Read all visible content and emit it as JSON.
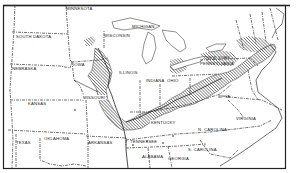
{
  "map": {
    "type": "distribution-map",
    "region": "Central and Eastern United States",
    "style": "black-and-white line drawing with diagonal hatching marking distribution area",
    "colors": {
      "ink": "#222222",
      "background": "#ffffff",
      "hatch": "#333333"
    },
    "labels": [
      {
        "id": "minnesota",
        "text": "MINNESOTA"
      },
      {
        "id": "south-dakota",
        "text": "SOUTH DAKOTA"
      },
      {
        "id": "wisconsin",
        "text": "WISCONSIN"
      },
      {
        "id": "michigan",
        "text": "MICHIGAN"
      },
      {
        "id": "iowa",
        "text": "IOWA"
      },
      {
        "id": "nebraska",
        "text": "NEBRASKA"
      },
      {
        "id": "illinois",
        "text": "ILLINOIS"
      },
      {
        "id": "indiana",
        "text": "INDIANA"
      },
      {
        "id": "ohio",
        "text": "OHIO"
      },
      {
        "id": "new-york",
        "text": "NEW YORK"
      },
      {
        "id": "pennsylvania",
        "text": "PENNSYLVANIA"
      },
      {
        "id": "kansas",
        "text": "KANSAS"
      },
      {
        "id": "missouri",
        "text": "MISSOURI"
      },
      {
        "id": "kentucky",
        "text": "KENTUCKY"
      },
      {
        "id": "west-virginia",
        "text": "W. VA."
      },
      {
        "id": "virginia",
        "text": "VIRGINIA"
      },
      {
        "id": "oklahoma",
        "text": "OKLAHOMA"
      },
      {
        "id": "texas",
        "text": "TEXAS"
      },
      {
        "id": "arkansas",
        "text": "ARKANSAS"
      },
      {
        "id": "tennessee",
        "text": "TENNESSEE"
      },
      {
        "id": "north-carolina",
        "text": "N. CAROLINA"
      },
      {
        "id": "south-carolina",
        "text": "S. CAROLINA"
      },
      {
        "id": "alabama",
        "text": "ALABAMA"
      },
      {
        "id": "georgia",
        "text": "GEORGIA"
      }
    ]
  }
}
